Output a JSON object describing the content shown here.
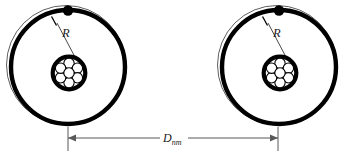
{
  "figure": {
    "name": "two-atom-separation-diagram",
    "background_color": "#ffffff",
    "stroke_color": "#000000",
    "dimension_line_color": "#595959"
  },
  "labels": {
    "radius": "R",
    "distance_base": "D",
    "distance_sub": "nm"
  },
  "atoms": [
    {
      "id": "left-atom",
      "center_x": 67,
      "center_y": 66,
      "outer_shell_r": 60,
      "orbit_r": 57,
      "nucleus_r": 18,
      "electron": {
        "x": 68,
        "y": 10,
        "r": 5
      },
      "radius_label_x": 62,
      "radius_label_y": 36
    },
    {
      "id": "right-atom",
      "center_x": 278,
      "center_y": 66,
      "outer_shell_r": 60,
      "orbit_r": 57,
      "nucleus_r": 18,
      "electron": {
        "x": 279,
        "y": 10,
        "r": 5
      },
      "radius_label_x": 273,
      "radius_label_y": 36
    }
  ],
  "nucleons": {
    "count": 7,
    "radius": 5.2,
    "offsets": [
      {
        "dx": 0,
        "dy": -9.6
      },
      {
        "dx": 8.4,
        "dy": -4.8
      },
      {
        "dx": 8.4,
        "dy": 4.8
      },
      {
        "dx": 0,
        "dy": 9.6
      },
      {
        "dx": -8.4,
        "dy": 4.8
      },
      {
        "dx": -8.4,
        "dy": -4.8
      },
      {
        "dx": 0,
        "dy": 0
      }
    ]
  },
  "dimension": {
    "y": 138,
    "x_start": 68,
    "x_end": 278,
    "ext_top": 127,
    "ext_bottom": 151,
    "label_x": 173,
    "label_y": 137
  }
}
